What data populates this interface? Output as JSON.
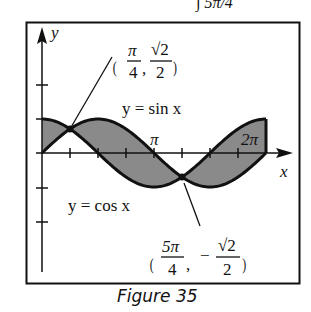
{
  "figure": {
    "caption": "Figure 35",
    "top_clipped_text": "∫ 5π/4",
    "axes": {
      "x_label": "x",
      "y_label": "y"
    },
    "tick_labels": {
      "pi": "π",
      "two_pi": "2π"
    },
    "curve_labels": {
      "sin": "y = sin x",
      "cos": "y = cos x"
    },
    "points": [
      {
        "name": "upper-intersection",
        "x_num": "π",
        "x_den": "4",
        "y_num": "√2",
        "y_den": "2",
        "y_sign": ""
      },
      {
        "name": "lower-intersection",
        "x_num": "5π",
        "x_den": "4",
        "y_num": "√2",
        "y_den": "2",
        "y_sign": "−"
      }
    ],
    "colors": {
      "ink": "#111111",
      "shade": "#8a8a8a",
      "background": "#ffffff"
    }
  },
  "chart_data": {
    "type": "area",
    "title": "Figure 35",
    "xlabel": "x",
    "ylabel": "y",
    "series": [
      {
        "name": "y = sin x",
        "function": "sin(x)"
      },
      {
        "name": "y = cos x",
        "function": "cos(x)"
      }
    ],
    "shaded_region": "between sin x and cos x for 0 ≤ x ≤ 2π",
    "x_range": [
      0,
      6.2832
    ],
    "x_ticks": [
      "π/4",
      "π/2",
      "3π/4",
      "π",
      "5π/4",
      "3π/2",
      "7π/4",
      "2π"
    ],
    "x_tick_labels_shown": [
      "π",
      "2π"
    ],
    "y_ticks": [
      -2,
      -1,
      1,
      2
    ],
    "intersections": [
      {
        "x": "π/4",
        "y": "√2/2",
        "x_value": 0.7854,
        "y_value": 0.7071
      },
      {
        "x": "5π/4",
        "y": "−√2/2",
        "x_value": 3.927,
        "y_value": -0.7071
      }
    ],
    "grid": false
  }
}
